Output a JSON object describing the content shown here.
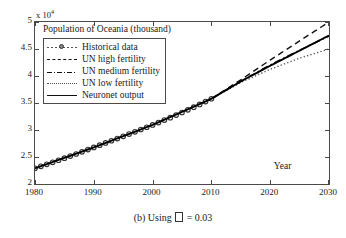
{
  "figure": {
    "caption_prefix": "(b) Using",
    "caption_glyph": "missing-glyph-box",
    "caption_suffix": "= 0.03",
    "caption_full": "(b) Using □ = 0.03"
  },
  "axis": {
    "exponent_prefix": "x 10",
    "exponent_power": "4",
    "year_annotation": "Year",
    "xticks": [
      "1980",
      "1990",
      "2000",
      "2010",
      "2020",
      "2030"
    ],
    "yticks": [
      "2",
      "2.5",
      "3",
      "3.5",
      "4",
      "4.5",
      "5"
    ]
  },
  "legend": {
    "entries": [
      {
        "label": "Historical data",
        "style": "dotted-marker"
      },
      {
        "label": "UN high fertility",
        "style": "dashed"
      },
      {
        "label": "UN medium fertility",
        "style": "dash-dot"
      },
      {
        "label": "UN low fertility",
        "style": "dotted"
      },
      {
        "label": "Neuronet output",
        "style": "solid"
      }
    ]
  },
  "chart_data": {
    "type": "line",
    "title": "Population of Oceania (thousand)",
    "xlabel": "Year",
    "ylabel": "",
    "y_exponent": 10000,
    "y_unit": "thousand",
    "xlim": [
      1980,
      2030
    ],
    "ylim": [
      2,
      5
    ],
    "xticks": [
      1980,
      1990,
      2000,
      2010,
      2020,
      2030
    ],
    "yticks": [
      2,
      2.5,
      3,
      3.5,
      4,
      4.5,
      5
    ],
    "grid": false,
    "legend_position": "upper-left",
    "annotations": [
      {
        "text": "Year",
        "x": 2023,
        "y": 2.32
      }
    ],
    "series": [
      {
        "name": "Historical data",
        "style": "dotted-marker",
        "marker": "circle-open",
        "color": "#555555",
        "x": [
          1980,
          1981,
          1982,
          1983,
          1984,
          1985,
          1986,
          1987,
          1988,
          1989,
          1990,
          1991,
          1992,
          1993,
          1994,
          1995,
          1996,
          1997,
          1998,
          1999,
          2000,
          2001,
          2002,
          2003,
          2004,
          2005,
          2006,
          2007,
          2008,
          2009,
          2010
        ],
        "values": [
          2.29,
          2.327,
          2.365,
          2.402,
          2.44,
          2.478,
          2.517,
          2.556,
          2.596,
          2.637,
          2.678,
          2.719,
          2.76,
          2.801,
          2.842,
          2.883,
          2.925,
          2.967,
          3.009,
          3.051,
          3.094,
          3.138,
          3.183,
          3.229,
          3.276,
          3.324,
          3.373,
          3.423,
          3.474,
          3.526,
          3.579
        ]
      },
      {
        "name": "UN high fertility",
        "style": "dashed",
        "color": "#111111",
        "x": [
          2010,
          2015,
          2020,
          2025,
          2030
        ],
        "values": [
          3.579,
          3.93,
          4.295,
          4.65,
          5.0
        ]
      },
      {
        "name": "UN medium fertility",
        "style": "dash-dot",
        "color": "#111111",
        "x": [
          2010,
          2015,
          2020,
          2025,
          2030
        ],
        "values": [
          3.579,
          3.905,
          4.205,
          4.48,
          4.735
        ]
      },
      {
        "name": "UN low fertility",
        "style": "dotted",
        "color": "#555555",
        "x": [
          2010,
          2015,
          2020,
          2025,
          2030
        ],
        "values": [
          3.579,
          3.88,
          4.125,
          4.33,
          4.5
        ]
      },
      {
        "name": "Neuronet output",
        "style": "solid",
        "color": "#000000",
        "x": [
          1980,
          1990,
          2000,
          2010,
          2015,
          2020,
          2025,
          2030
        ],
        "values": [
          2.29,
          2.678,
          3.094,
          3.579,
          3.9,
          4.19,
          4.47,
          4.75
        ]
      }
    ]
  }
}
